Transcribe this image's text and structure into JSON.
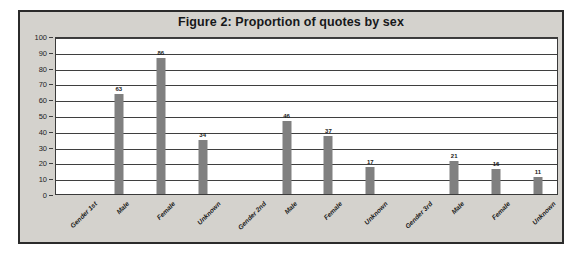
{
  "figure": {
    "title": "Figure 2: Proportion of quotes by sex",
    "frame_bg": "#d4d2cd",
    "plot_bg": "#ffffff",
    "border_color": "#2b2b2b",
    "bar_color": "#808080"
  },
  "chart_data": {
    "type": "bar",
    "title": "Figure 2: Proportion of quotes by sex",
    "xlabel": "",
    "ylabel": "",
    "ylim": [
      0,
      100
    ],
    "yticks": [
      0,
      10,
      20,
      30,
      40,
      50,
      60,
      70,
      80,
      90,
      100
    ],
    "grid": true,
    "legend": false,
    "categories": [
      "Gender 1st",
      "Male",
      "Female",
      "Unknown",
      "Gender 2nd",
      "Male",
      "Female",
      "Unknown",
      "Gender 3rd",
      "Male",
      "Female",
      "Unknown"
    ],
    "values": [
      null,
      63,
      86,
      34,
      null,
      46,
      37,
      17,
      null,
      21,
      16,
      11
    ],
    "data_labels": [
      "",
      "63",
      "86",
      "34",
      "",
      "46",
      "37",
      "17",
      "",
      "21",
      "16",
      "11"
    ]
  }
}
